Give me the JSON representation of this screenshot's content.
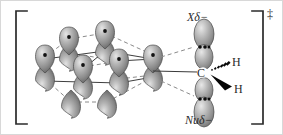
{
  "figure": {
    "kind": "orbital-transition-state-diagram",
    "background_color": "#ffffff",
    "border_color": "#d8d8d8",
    "width": 283,
    "height": 135
  },
  "labels": {
    "leaving_group": {
      "symbol": "X",
      "charge": "δ−",
      "full": "Xδ−"
    },
    "nucleophile": {
      "symbol": "Nu",
      "charge": "δ−",
      "full": "Nuδ−"
    },
    "central_atom": "C",
    "hydrogen_upper": "H",
    "hydrogen_lower": "H",
    "transition_state_marker": "‡"
  },
  "brackets": {
    "left": {
      "x": 15,
      "top": 10,
      "bottom": 123,
      "arm": 11
    },
    "right": {
      "x": 262,
      "top": 10,
      "bottom": 123,
      "arm": 11
    },
    "color": "#2b2b2b",
    "stroke_width": 1.6
  },
  "colors": {
    "orbital_fill_light": "#d2d2d2",
    "orbital_fill_mid": "#9a9a9a",
    "orbital_fill_dark": "#6e6e6e",
    "orbital_stroke": "#4a4a4a",
    "electron_dot": "#111111",
    "bond_solid": "#3a3a3a",
    "bond_dashed": "#7a7a7a",
    "wedge": "#000000",
    "text": "#2b2b2b"
  },
  "lattice": {
    "description": "hexagonal array of p-orbital lobes representing a graphite-like surface",
    "up_lobes": [
      {
        "id": "u1",
        "cx": 68,
        "cy": 40,
        "rx": 9.5,
        "ry": 14,
        "dot": true
      },
      {
        "id": "u2",
        "cx": 104,
        "cy": 34,
        "rx": 9.5,
        "ry": 14,
        "dot": true
      },
      {
        "id": "u3",
        "cx": 44,
        "cy": 56,
        "rx": 9.5,
        "ry": 14,
        "dot": true
      },
      {
        "id": "u4",
        "cx": 82,
        "cy": 66,
        "rx": 9.5,
        "ry": 14,
        "dot": true
      },
      {
        "id": "u5",
        "cx": 118,
        "cy": 62,
        "rx": 9.5,
        "ry": 14,
        "dot": true
      },
      {
        "id": "u6",
        "cx": 152,
        "cy": 56,
        "rx": 9.5,
        "ry": 14,
        "dot": true
      }
    ],
    "down_lobes": [
      {
        "id": "d1",
        "cx": 68,
        "cy": 54,
        "rx": 9.5,
        "ry": 14
      },
      {
        "id": "d2",
        "cx": 104,
        "cy": 48,
        "rx": 9.5,
        "ry": 14
      },
      {
        "id": "d3",
        "cx": 44,
        "cy": 74,
        "rx": 9.5,
        "ry": 14
      },
      {
        "id": "d4",
        "cx": 82,
        "cy": 82,
        "rx": 9.5,
        "ry": 14
      },
      {
        "id": "d5",
        "cx": 118,
        "cy": 78,
        "rx": 9.5,
        "ry": 14
      },
      {
        "id": "d6",
        "cx": 152,
        "cy": 74,
        "rx": 9.5,
        "ry": 14
      },
      {
        "id": "d7",
        "cx": 70,
        "cy": 101,
        "rx": 9.5,
        "ry": 14
      },
      {
        "id": "d8",
        "cx": 106,
        "cy": 101,
        "rx": 9.5,
        "ry": 14
      }
    ],
    "solid_edges": [
      [
        44,
        58,
        104,
        50
      ],
      [
        104,
        50,
        152,
        58
      ],
      [
        44,
        80,
        118,
        82
      ],
      [
        118,
        82,
        152,
        76
      ],
      [
        44,
        58,
        44,
        80
      ],
      [
        104,
        50,
        82,
        68
      ],
      [
        152,
        58,
        152,
        76
      ]
    ],
    "dashed_edges": [
      [
        68,
        42,
        104,
        36
      ],
      [
        44,
        58,
        68,
        42
      ],
      [
        104,
        36,
        152,
        58
      ],
      [
        68,
        56,
        118,
        64
      ],
      [
        82,
        68,
        118,
        64
      ],
      [
        70,
        103,
        106,
        103
      ],
      [
        44,
        80,
        70,
        103
      ],
      [
        106,
        103,
        152,
        76
      ]
    ]
  },
  "reaction_center": {
    "carbon": {
      "cx": 203,
      "cy": 72
    },
    "x_orbital": {
      "upper_lobe": {
        "cx": 203,
        "cy": 33,
        "rx": 10,
        "ry": 15
      },
      "inner_lobe": {
        "cx": 203,
        "cy": 55,
        "rx": 9,
        "ry": 12
      },
      "electron_pair_y": 46
    },
    "nu_orbital": {
      "lower_lobe": {
        "cx": 203,
        "cy": 111,
        "rx": 10,
        "ry": 15
      },
      "inner_lobe": {
        "cx": 203,
        "cy": 89,
        "rx": 9,
        "ry": 12
      },
      "electron_pair_y": 98
    },
    "bond_to_lattice": {
      "x1": 152,
      "y1": 72,
      "x2": 196,
      "y2": 72,
      "style": "solid"
    },
    "dashed_to_upper": {
      "x1": 161,
      "y1": 58,
      "x2": 194,
      "y2": 45,
      "style": "dashed"
    },
    "dashed_to_lower": {
      "x1": 161,
      "y1": 82,
      "x2": 194,
      "y2": 96,
      "style": "dashed"
    },
    "hash_wedge": {
      "from_x": 209,
      "from_y": 70,
      "to_x": 230,
      "to_y": 60,
      "dashes": 7
    },
    "solid_wedge": {
      "from_x": 209,
      "from_y": 75,
      "to_x": 231,
      "to_y": 88
    }
  }
}
